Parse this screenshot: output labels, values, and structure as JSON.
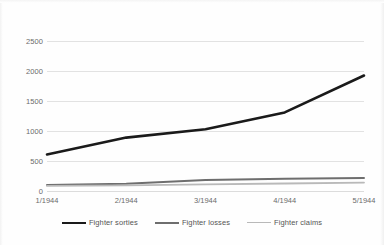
{
  "chart_data": {
    "type": "line",
    "title": "",
    "subtitle": "",
    "xlabel": "",
    "ylabel": "",
    "categories": [
      "1/1944",
      "2/1944",
      "3/1944",
      "4/1944",
      "5/1944"
    ],
    "ylim": [
      0,
      2500
    ],
    "yticks": [
      0,
      500,
      1000,
      1500,
      2000,
      2500
    ],
    "ytick_labels": [
      "0",
      "500",
      "1000",
      "1500",
      "2000",
      "2500"
    ],
    "grid": true,
    "legend_position": "bottom",
    "series": [
      {
        "name": "Fighter sorties",
        "values": [
          610,
          890,
          1030,
          1310,
          1925
        ],
        "color": "#1a1a1a",
        "width": 2.6
      },
      {
        "name": "Fighter losses",
        "values": [
          100,
          120,
          185,
          205,
          215
        ],
        "color": "#6e6e6e",
        "width": 2.0
      },
      {
        "name": "Fighter claims",
        "values": [
          85,
          95,
          110,
          125,
          140
        ],
        "color": "#b9b9b9",
        "width": 1.8
      }
    ]
  },
  "legend": {
    "items": [
      {
        "label": "Fighter sorties",
        "color": "#1a1a1a",
        "width": "2.6px"
      },
      {
        "label": "Fighter losses",
        "color": "#6e6e6e",
        "width": "2.0px"
      },
      {
        "label": "Fighter claims",
        "color": "#b9b9b9",
        "width": "1.6px"
      }
    ]
  },
  "colors": {
    "background": "#fefefe",
    "gridline": "#e2e2e2",
    "tick_text": "#6b6b6b"
  }
}
